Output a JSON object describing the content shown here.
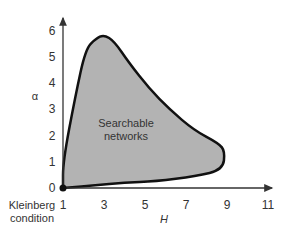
{
  "chart_data": {
    "type": "area",
    "title": "",
    "xlabel": "H",
    "ylabel": "α",
    "x_ticks": [
      "1",
      "3",
      "5",
      "7",
      "9",
      "11"
    ],
    "y_ticks": [
      "0",
      "1",
      "2",
      "3",
      "4",
      "5",
      "6"
    ],
    "xlim": [
      1,
      12
    ],
    "ylim": [
      0,
      6.5
    ],
    "grid": false,
    "annotations": [
      {
        "text": "Searchable networks",
        "x": 4.6,
        "y": 2.5
      },
      {
        "text": "Kleinberg condition",
        "x": 1,
        "y": 0,
        "note": "marked point at origin (H=1, α=0)"
      }
    ],
    "region": {
      "name": "Searchable networks",
      "fill": "#b3b3b3",
      "boundary": [
        [
          1,
          0
        ],
        [
          1,
          1
        ],
        [
          1.6,
          3.5
        ],
        [
          2.1,
          5.3
        ],
        [
          2.6,
          5.7
        ],
        [
          3.0,
          5.85
        ],
        [
          3.5,
          5.6
        ],
        [
          4.2,
          4.8
        ],
        [
          5.2,
          3.8
        ],
        [
          6.2,
          3.0
        ],
        [
          7.4,
          2.2
        ],
        [
          8.6,
          1.7
        ],
        [
          8.9,
          1.4
        ],
        [
          8.8,
          0.7
        ],
        [
          7.5,
          0.45
        ],
        [
          5.5,
          0.25
        ],
        [
          4,
          0.2
        ],
        [
          2.5,
          0.1
        ],
        [
          1,
          0
        ]
      ]
    }
  },
  "labels": {
    "searchable": [
      "Searchable",
      "networks"
    ],
    "kleinberg": [
      "Kleinberg",
      "condition"
    ],
    "x_axis": "H",
    "y_axis": "α"
  }
}
